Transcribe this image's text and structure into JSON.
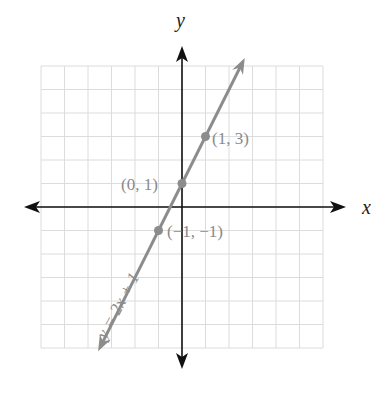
{
  "chart_data": {
    "type": "line",
    "title": "",
    "xlabel": "x",
    "ylabel": "y",
    "xlim": [
      -6,
      6
    ],
    "ylim": [
      -6,
      6
    ],
    "grid": true,
    "series": [
      {
        "name": "y = 2x + 1",
        "equation": "y = 2x + 1",
        "color": "#8c8c8c",
        "line_from": [
          -3.4,
          -5.8
        ],
        "line_to": [
          2.5,
          6.0
        ],
        "points": [
          {
            "x": 1,
            "y": 3,
            "label": "(1, 3)"
          },
          {
            "x": 0,
            "y": 1,
            "label": "(0, 1)"
          },
          {
            "x": -1,
            "y": -1,
            "label": "(−1, −1)"
          }
        ]
      }
    ]
  },
  "labels": {
    "x_axis": "x",
    "y_axis": "y",
    "equation": "y = 2x + 1",
    "p1": "(1, 3)",
    "p2": "(0, 1)",
    "p3": "(−1, −1)"
  },
  "colors": {
    "axis": "#111111",
    "grid": "#dcdcdc",
    "line": "#8c8c8c",
    "point": "#8c8c8c",
    "label": "#8a8a8a"
  }
}
